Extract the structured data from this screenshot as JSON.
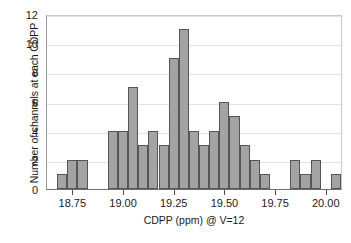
{
  "chart_data": {
    "type": "bar",
    "title": "",
    "xlabel": "CDPP (ppm) @ V=12",
    "ylabel": "Number of channels at each CDPP",
    "xlim": [
      18.62,
      20.08
    ],
    "ylim": [
      0,
      12
    ],
    "grid": true,
    "legend": null,
    "bin_width": 0.05,
    "xticks": [
      18.75,
      19.0,
      19.25,
      19.5,
      19.75,
      20.0
    ],
    "xtick_labels": [
      "18.75",
      "19.00",
      "19.25",
      "19.50",
      "19.75",
      "20.00"
    ],
    "yticks": [
      0,
      2,
      4,
      6,
      8,
      10,
      12
    ],
    "ytick_labels": [
      "0",
      "2",
      "4",
      "6",
      "8",
      "10",
      "12"
    ],
    "bar_color": "#a3a3a3",
    "bar_edge_color": "#555555",
    "bins": [
      18.67,
      18.72,
      18.77,
      18.82,
      18.87,
      18.92,
      18.97,
      19.02,
      19.07,
      19.12,
      19.17,
      19.22,
      19.27,
      19.32,
      19.37,
      19.42,
      19.47,
      19.52,
      19.57,
      19.62,
      19.67,
      19.72,
      19.77,
      19.82,
      19.87,
      19.92,
      19.97,
      20.02
    ],
    "categories": [
      "18.67",
      "18.72",
      "18.77",
      "18.82",
      "18.87",
      "18.92",
      "18.97",
      "19.02",
      "19.07",
      "19.12",
      "19.17",
      "19.22",
      "19.27",
      "19.32",
      "19.37",
      "19.42",
      "19.47",
      "19.52",
      "19.57",
      "19.62",
      "19.67",
      "19.72",
      "19.77",
      "19.82",
      "19.87",
      "19.92",
      "19.97",
      "20.02"
    ],
    "values": [
      1,
      2,
      2,
      0,
      0,
      4,
      4,
      7,
      3,
      4,
      3,
      9,
      11,
      4,
      3,
      4,
      6,
      5,
      3,
      2,
      1,
      0,
      0,
      2,
      1,
      2,
      0,
      1
    ]
  }
}
